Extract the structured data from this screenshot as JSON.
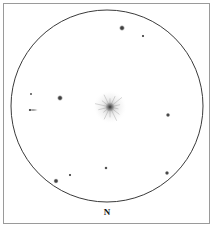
{
  "chart_data": {
    "type": "scatter",
    "title": "",
    "subtitle": "",
    "xlabel": "",
    "ylabel": "",
    "grid": false,
    "legend": null,
    "axis_ranges": {
      "x": [
        0,
        215
      ],
      "y": [
        0,
        230
      ]
    },
    "field_circle": {
      "cx": 107,
      "cy": 106,
      "r": 96,
      "stroke": "#3a3a3a",
      "stroke_width": 1,
      "fill": "none"
    },
    "orientation_labels": [
      {
        "text": "N",
        "x": 107,
        "y": 213,
        "font_size": 9,
        "weight": "bold"
      }
    ],
    "deep_sky_objects": [
      {
        "name": "central-nebulous-object",
        "kind": "diffuse-cluster",
        "x": 110,
        "y": 107,
        "core_radius": 4.5,
        "halo_radius": 17,
        "ray_count": 14,
        "ray_length": 15,
        "brightness": "bright"
      },
      {
        "name": "edge-on-galaxy",
        "kind": "elongated-streak",
        "x": 33,
        "y": 110,
        "length": 11,
        "thickness": 1.6,
        "angle": 0,
        "brightness": "faint"
      }
    ],
    "stars": [
      {
        "name": "star-upper-right-bright",
        "x": 122,
        "y": 28,
        "r": 3.0,
        "mag": "bright"
      },
      {
        "name": "star-upper-right-faint",
        "x": 143,
        "y": 36,
        "r": 1.5,
        "mag": "faint"
      },
      {
        "name": "star-left-upper-faint",
        "x": 31,
        "y": 94,
        "r": 1.2,
        "mag": "very-faint"
      },
      {
        "name": "star-mid-left-bright",
        "x": 60,
        "y": 98,
        "r": 3.0,
        "mag": "bright"
      },
      {
        "name": "star-right-mid",
        "x": 168,
        "y": 115,
        "r": 2.3,
        "mag": "medium"
      },
      {
        "name": "star-lower-mid",
        "x": 106,
        "y": 168,
        "r": 1.8,
        "mag": "faint"
      },
      {
        "name": "star-lower-right",
        "x": 167,
        "y": 173,
        "r": 2.3,
        "mag": "medium"
      },
      {
        "name": "star-lower-left-faint",
        "x": 70,
        "y": 175,
        "r": 1.5,
        "mag": "faint"
      },
      {
        "name": "star-lower-left-bright",
        "x": 56,
        "y": 181,
        "r": 2.7,
        "mag": "bright"
      }
    ],
    "colors": {
      "background": "#ffffff",
      "frame_border": "#9a9a9a",
      "circle_stroke": "#3a3a3a",
      "star_fill": "#2b2b2b",
      "label_text": "#111111"
    }
  }
}
